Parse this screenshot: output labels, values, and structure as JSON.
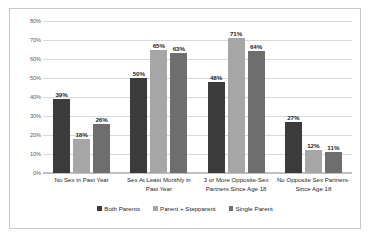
{
  "chart_data": {
    "type": "bar",
    "title": "",
    "xlabel": "",
    "ylabel": "",
    "ylim": [
      0,
      80
    ],
    "ytick_labels": [
      "80%",
      "70%",
      "60%",
      "50%",
      "40%",
      "30%",
      "20%",
      "10%",
      "0%"
    ],
    "ytick_values": [
      80,
      70,
      60,
      50,
      40,
      30,
      20,
      10,
      0
    ],
    "grid": true,
    "legend_position": "bottom",
    "categories": [
      "No Sex in Past Year",
      "Sex At Least Monthly in Past Year",
      "3 or More Opposite-Sex Partners Since Age 18",
      "No Opposite Sex Partners-Since Age 18"
    ],
    "series": [
      {
        "name": "Both Parents",
        "color": "#3b3b3b",
        "values": [
          39,
          50,
          48,
          27
        ],
        "labels": [
          "39%",
          "50%",
          "48%",
          "27%"
        ]
      },
      {
        "name": "Parent + Stepparent",
        "color": "#a6a6a6",
        "values": [
          18,
          65,
          71,
          12
        ],
        "labels": [
          "18%",
          "65%",
          "71%",
          "12%"
        ]
      },
      {
        "name": "Single Parent",
        "color": "#6e6e6e",
        "values": [
          26,
          63,
          64,
          11
        ],
        "labels": [
          "26%",
          "63%",
          "64%",
          "11%"
        ]
      }
    ]
  },
  "style": {
    "border_color": "#c8c8c8",
    "gridline_color": "#d9d9d9",
    "axis_color": "#bfbfbf",
    "text_color": "#262626",
    "tick_color": "#5a5a5a",
    "background": "#ffffff"
  }
}
